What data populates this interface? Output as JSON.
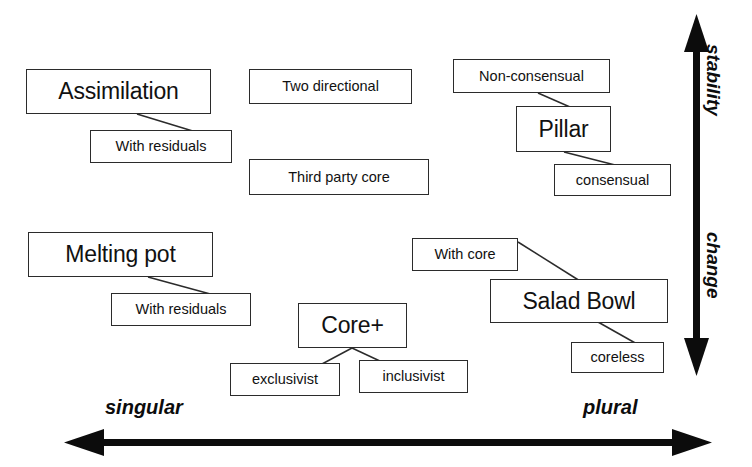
{
  "diagram": {
    "ink_color": "#2b2b2b",
    "background_color": "#ffffff"
  },
  "axes": {
    "vertical": {
      "icon": "double-headed-vertical-arrow",
      "top_label": "stability",
      "bottom_label": "change"
    },
    "horizontal": {
      "icon": "double-headed-horizontal-arrow",
      "left_label": "singular",
      "right_label": "plural"
    }
  },
  "nodes": {
    "assimilation": "Assimilation",
    "assimilation_residuals": "With residuals",
    "two_directional": "Two directional",
    "third_party_core": "Third party core",
    "non_consensual": "Non-consensual",
    "pillar": "Pillar",
    "consensual": "consensual",
    "melting_pot": "Melting pot",
    "melting_pot_residuals": "With residuals",
    "core_plus": "Core+",
    "exclusivist": "exclusivist",
    "inclusivist": "inclusivist",
    "with_core": "With core",
    "salad_bowl": "Salad Bowl",
    "coreless": "coreless"
  },
  "connectors": [
    {
      "from": "assimilation",
      "to": "assimilation_residuals"
    },
    {
      "from": "non_consensual",
      "to": "pillar"
    },
    {
      "from": "pillar",
      "to": "consensual"
    },
    {
      "from": "melting_pot",
      "to": "melting_pot_residuals"
    },
    {
      "from": "core_plus",
      "to": "exclusivist"
    },
    {
      "from": "core_plus",
      "to": "inclusivist"
    },
    {
      "from": "with_core",
      "to": "salad_bowl"
    },
    {
      "from": "salad_bowl",
      "to": "coreless"
    }
  ]
}
